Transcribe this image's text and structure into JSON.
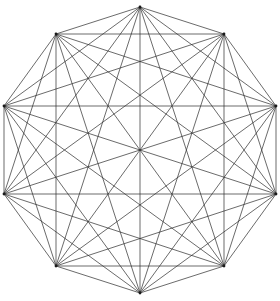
{
  "figure": {
    "shape_name": "decagon-complete-graph",
    "background_color": "#ffffff",
    "line_color": "#2b2b2b",
    "line_width": 0.7,
    "vertex_count": 10,
    "edge_count": 45,
    "center": {
      "x": 140,
      "y": 150
    },
    "radius": 143,
    "start_angle_degrees": 90,
    "angle_step_degrees": 36,
    "canvas": {
      "width": 280,
      "height": 301
    }
  },
  "chart_data": {
    "type": "scatter",
    "xlabel": "",
    "ylabel": "",
    "grid": false,
    "legend": "none",
    "xlim": [
      0,
      280
    ],
    "ylim": [
      0,
      301
    ],
    "vertices": [
      {
        "id": 0,
        "angle_degrees": 90,
        "x": 140,
        "y": 7
      },
      {
        "id": 1,
        "angle_degrees": 54,
        "x": 224,
        "y": 34
      },
      {
        "id": 2,
        "angle_degrees": 18,
        "x": 276,
        "y": 106
      },
      {
        "id": 3,
        "angle_degrees": 342,
        "x": 276,
        "y": 194
      },
      {
        "id": 4,
        "angle_degrees": 306,
        "x": 224,
        "y": 266
      },
      {
        "id": 5,
        "angle_degrees": 270,
        "x": 140,
        "y": 293
      },
      {
        "id": 6,
        "angle_degrees": 234,
        "x": 56,
        "y": 266
      },
      {
        "id": 7,
        "angle_degrees": 198,
        "x": 4,
        "y": 194
      },
      {
        "id": 8,
        "angle_degrees": 162,
        "x": 4,
        "y": 106
      },
      {
        "id": 9,
        "angle_degrees": 126,
        "x": 56,
        "y": 34
      }
    ],
    "edges": [
      [
        0,
        1
      ],
      [
        0,
        2
      ],
      [
        0,
        3
      ],
      [
        0,
        4
      ],
      [
        0,
        5
      ],
      [
        0,
        6
      ],
      [
        0,
        7
      ],
      [
        0,
        8
      ],
      [
        0,
        9
      ],
      [
        1,
        2
      ],
      [
        1,
        3
      ],
      [
        1,
        4
      ],
      [
        1,
        5
      ],
      [
        1,
        6
      ],
      [
        1,
        7
      ],
      [
        1,
        8
      ],
      [
        1,
        9
      ],
      [
        2,
        3
      ],
      [
        2,
        4
      ],
      [
        2,
        5
      ],
      [
        2,
        6
      ],
      [
        2,
        7
      ],
      [
        2,
        8
      ],
      [
        2,
        9
      ],
      [
        3,
        4
      ],
      [
        3,
        5
      ],
      [
        3,
        6
      ],
      [
        3,
        7
      ],
      [
        3,
        8
      ],
      [
        3,
        9
      ],
      [
        4,
        5
      ],
      [
        4,
        6
      ],
      [
        4,
        7
      ],
      [
        4,
        8
      ],
      [
        4,
        9
      ],
      [
        5,
        6
      ],
      [
        5,
        7
      ],
      [
        5,
        8
      ],
      [
        5,
        9
      ],
      [
        6,
        7
      ],
      [
        6,
        8
      ],
      [
        6,
        9
      ],
      [
        7,
        8
      ],
      [
        7,
        9
      ],
      [
        8,
        9
      ]
    ]
  }
}
